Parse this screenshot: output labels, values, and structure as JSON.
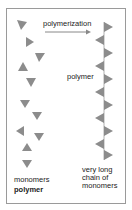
{
  "labels": {
    "arrow_label": "polymerization",
    "chain_label": "polymer",
    "monomers_label": "monomers",
    "section_label": "polymer",
    "chain_caption_1": "very long",
    "chain_caption_2": "chain of",
    "chain_caption_3": "monomers"
  },
  "colors": {
    "triangle": "#8c8c8c",
    "line": "#b0b0b0",
    "arrow": "#888888",
    "border": "#9a9a9a"
  }
}
